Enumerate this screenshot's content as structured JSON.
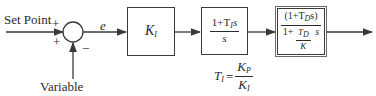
{
  "inputs": {
    "setpoint_label": "Set Point",
    "variable_label": "Variable",
    "plus_top": "+",
    "plus_bottom": "+",
    "minus": "−"
  },
  "signals": {
    "error_label": "e"
  },
  "blocks": [
    {
      "id": "gain",
      "main": "K",
      "sub": "I"
    },
    {
      "id": "integral",
      "num_a": "1+T",
      "num_sub": "I",
      "num_b": "s",
      "den": "s"
    },
    {
      "id": "derivative",
      "num_a": "(1+T",
      "num_sub": "D",
      "num_b": "s)",
      "den_a": "1+",
      "den_frac_num": "T",
      "den_frac_num_sub": "D",
      "den_frac_den": "K",
      "den_b": "s"
    }
  ],
  "annotation": {
    "lhs": "T",
    "lhs_sub": "I",
    "eq": "=",
    "num": "K",
    "num_sub": "P",
    "den": "K",
    "den_sub": "I"
  },
  "colors": {
    "line": "#3a3a3a",
    "background": "#ffffff"
  }
}
